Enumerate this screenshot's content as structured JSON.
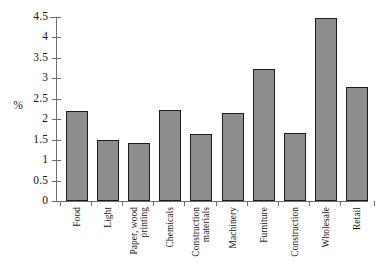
{
  "chart_data": {
    "type": "bar",
    "title": "",
    "subtitle": "",
    "xlabel": "",
    "ylabel": "%",
    "ylim": [
      0,
      4.5
    ],
    "grid": false,
    "legend": null,
    "categories": [
      "Food",
      "Light",
      "Paper, wood\nprinting",
      "Chemicals",
      "Construction\nmaterials",
      "Machinery",
      "Furniture",
      "Construction",
      "Wholesale",
      "Retail"
    ],
    "values": [
      2.2,
      1.5,
      1.42,
      2.22,
      1.63,
      2.14,
      3.23,
      1.66,
      4.47,
      2.78
    ],
    "ytick_labels": [
      "0",
      "0.5",
      "1",
      "1.5",
      "2",
      "2.5",
      "3",
      "3.5",
      "4",
      "4.5"
    ],
    "ytick_values": [
      0,
      0.5,
      1,
      1.5,
      2,
      2.5,
      3,
      3.5,
      4,
      4.5
    ],
    "bar_color": "#8d8d8d",
    "bar_border_color": "#1d1d1d",
    "axis_color": "#6f6f6f"
  }
}
